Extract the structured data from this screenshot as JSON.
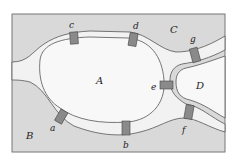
{
  "diagram": {
    "colors": {
      "land": "#d9d9d9",
      "river": "#f2f2f2",
      "island": "#f6f6f6",
      "bridge": "#8a8a8a",
      "outline": "#555555"
    },
    "regions": [
      {
        "id": "A",
        "label": "A"
      },
      {
        "id": "B",
        "label": "B"
      },
      {
        "id": "C",
        "label": "C"
      },
      {
        "id": "D",
        "label": "D"
      }
    ],
    "bridges": [
      {
        "id": "a",
        "label": "a"
      },
      {
        "id": "b",
        "label": "b"
      },
      {
        "id": "c",
        "label": "c"
      },
      {
        "id": "d",
        "label": "d"
      },
      {
        "id": "e",
        "label": "e"
      },
      {
        "id": "f",
        "label": "f"
      },
      {
        "id": "g",
        "label": "g"
      }
    ]
  }
}
